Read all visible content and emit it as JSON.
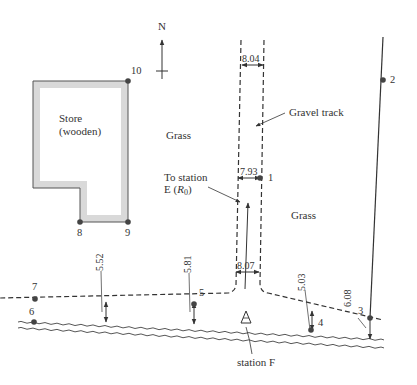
{
  "north_label": "N",
  "labels": {
    "store_line1": "Store",
    "store_line2": "(wooden)",
    "grass_left": "Grass",
    "grass_right": "Grass",
    "gravel_track": "Gravel track",
    "to_station_line1": "To station",
    "to_station_line2_prefix": "E (",
    "to_station_R": "R",
    "to_station_sub": "0",
    "to_station_line2_suffix": ")",
    "station_f": "station F"
  },
  "points": [
    {
      "id": "1",
      "label": "1"
    },
    {
      "id": "2",
      "label": "2"
    },
    {
      "id": "3",
      "label": "3"
    },
    {
      "id": "4",
      "label": "4"
    },
    {
      "id": "5",
      "label": "5"
    },
    {
      "id": "6",
      "label": "6"
    },
    {
      "id": "7",
      "label": "7"
    },
    {
      "id": "8",
      "label": "8"
    },
    {
      "id": "9",
      "label": "9"
    },
    {
      "id": "10",
      "label": "10"
    }
  ],
  "dimensions": {
    "track_top": "8.04",
    "track_mid": "7.93",
    "track_bottom": "8.07",
    "offset_5_52": "5.52",
    "offset_5_81": "5.81",
    "offset_5_03": "5.03",
    "offset_6_08": "6.08"
  },
  "colors": {
    "ink": "#333333",
    "wall_fill": "#d9d9d9",
    "point": "#444444"
  }
}
